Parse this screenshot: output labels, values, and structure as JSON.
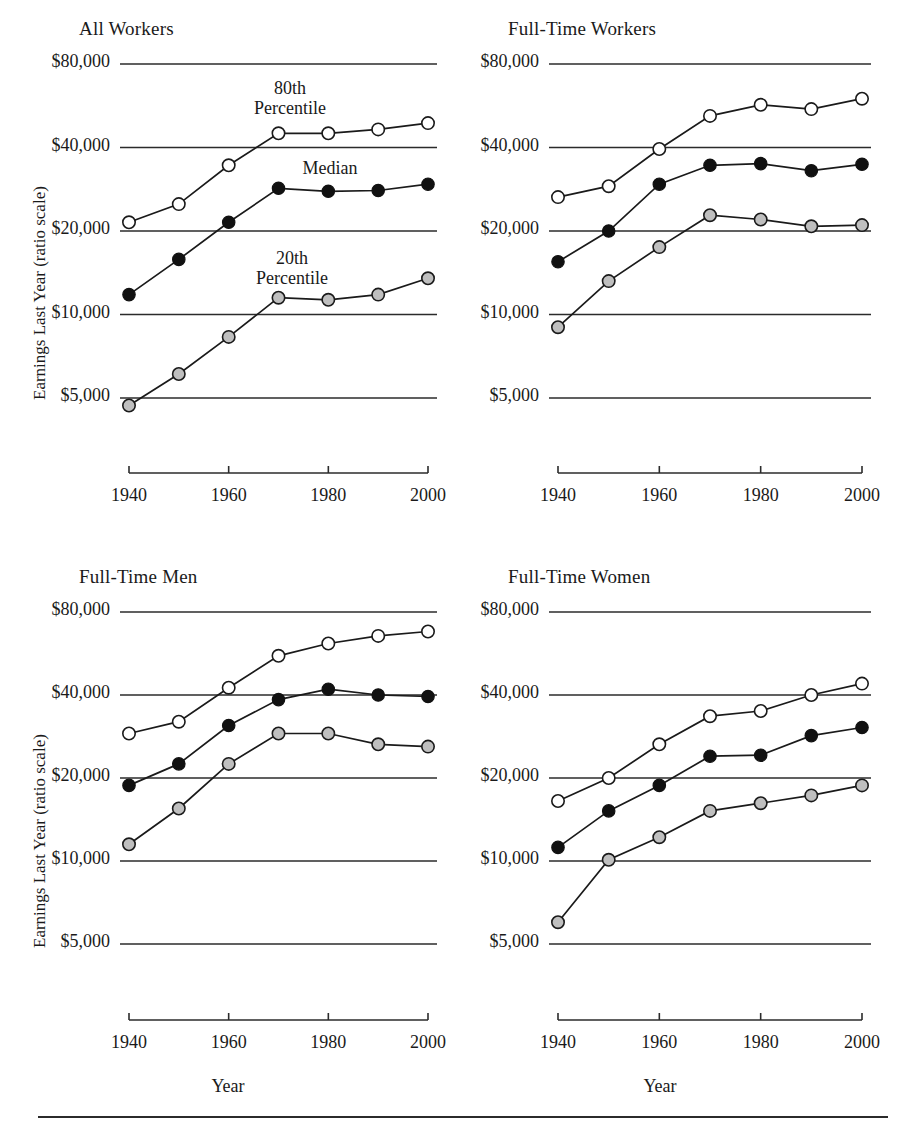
{
  "figure": {
    "background": "#ffffff",
    "footer_rule": true
  },
  "axis": {
    "ylabel": "Earnings Last Year (ratio scale)",
    "xlabel": "Year",
    "yticks": [
      "$80,000",
      "$40,000",
      "$20,000",
      "$10,000",
      "$5,000"
    ],
    "ytick_values": [
      80000,
      40000,
      20000,
      10000,
      5000
    ],
    "xticks": [
      "1940",
      "1960",
      "1980",
      "2000"
    ],
    "xtick_values": [
      1940,
      1960,
      1980,
      2000
    ],
    "xlim": [
      1935,
      2005
    ],
    "ylim": [
      4000,
      95000
    ],
    "scale": "log",
    "grid": "horizontal"
  },
  "series_styles": [
    {
      "key": "p80",
      "label": "80th Percentile",
      "marker": "open-circle",
      "fill": "#ffffff",
      "stroke": "#1a1a1a"
    },
    {
      "key": "median",
      "label": "Median",
      "marker": "filled-circle",
      "fill": "#111111",
      "stroke": "#111111"
    },
    {
      "key": "p20",
      "label": "20th Percentile",
      "marker": "gray-circle",
      "fill": "#bfbfbf",
      "stroke": "#1a1a1a"
    }
  ],
  "annotations": {
    "p80": {
      "line1": "80th",
      "line2": "Percentile"
    },
    "median": {
      "line1": "Median",
      "line2": ""
    },
    "p20": {
      "line1": "20th",
      "line2": "Percentile"
    }
  },
  "chart_data": [
    {
      "type": "line",
      "title": "All Workers",
      "xlabel": "",
      "ylabel": "Earnings Last Year (ratio scale)",
      "x": [
        1940,
        1950,
        1960,
        1970,
        1980,
        1990,
        2000
      ],
      "xlim": [
        1935,
        2005
      ],
      "ylim": [
        4000,
        95000
      ],
      "yscale": "log",
      "grid": true,
      "legend": "inline-annotations",
      "series": [
        {
          "name": "80th Percentile",
          "key": "p80",
          "values": [
            21500,
            25000,
            34500,
            45000,
            45000,
            46500,
            49000
          ]
        },
        {
          "name": "Median",
          "key": "median",
          "values": [
            11800,
            15800,
            21500,
            28500,
            27800,
            28000,
            29500
          ]
        },
        {
          "name": "20th Percentile",
          "key": "p20",
          "values": [
            4700,
            6100,
            8300,
            11500,
            11300,
            11800,
            13500
          ]
        }
      ]
    },
    {
      "type": "line",
      "title": "Full-Time  Workers",
      "xlabel": "",
      "ylabel": "",
      "x": [
        1940,
        1950,
        1960,
        1970,
        1980,
        1990,
        2000
      ],
      "xlim": [
        1935,
        2005
      ],
      "ylim": [
        4000,
        95000
      ],
      "yscale": "log",
      "grid": true,
      "legend": "none",
      "series": [
        {
          "name": "80th Percentile",
          "key": "p80",
          "values": [
            26500,
            29000,
            39500,
            52000,
            57000,
            55000,
            60000
          ]
        },
        {
          "name": "Median",
          "key": "median",
          "values": [
            15500,
            20000,
            29500,
            34500,
            35000,
            33000,
            34800
          ]
        },
        {
          "name": "20th Percentile",
          "key": "p20",
          "values": [
            9000,
            13200,
            17500,
            22800,
            22000,
            20800,
            21000
          ]
        }
      ]
    },
    {
      "type": "line",
      "title": "Full-Time  Men",
      "xlabel": "Year",
      "ylabel": "Earnings Last Year (ratio scale)",
      "x": [
        1940,
        1950,
        1960,
        1970,
        1980,
        1990,
        2000
      ],
      "xlim": [
        1935,
        2005
      ],
      "ylim": [
        4000,
        95000
      ],
      "yscale": "log",
      "grid": true,
      "legend": "none",
      "series": [
        {
          "name": "80th Percentile",
          "key": "p80",
          "values": [
            29000,
            32000,
            42500,
            55500,
            61500,
            65500,
            68000
          ]
        },
        {
          "name": "Median",
          "key": "median",
          "values": [
            18800,
            22500,
            31000,
            38500,
            42000,
            40000,
            39500
          ]
        },
        {
          "name": "20th Percentile",
          "key": "p20",
          "values": [
            11500,
            15500,
            22500,
            29000,
            29000,
            26500,
            26000
          ]
        }
      ]
    },
    {
      "type": "line",
      "title": "Full-Time  Women",
      "xlabel": "Year",
      "ylabel": "",
      "x": [
        1940,
        1950,
        1960,
        1970,
        1980,
        1990,
        2000
      ],
      "xlim": [
        1935,
        2005
      ],
      "ylim": [
        4000,
        95000
      ],
      "yscale": "log",
      "grid": true,
      "legend": "none",
      "series": [
        {
          "name": "80th Percentile",
          "key": "p80",
          "values": [
            16500,
            20000,
            26500,
            33500,
            35000,
            40000,
            44000
          ]
        },
        {
          "name": "Median",
          "key": "median",
          "values": [
            11200,
            15200,
            18800,
            24000,
            24200,
            28500,
            30500
          ]
        },
        {
          "name": "20th Percentile",
          "key": "p20",
          "values": [
            6000,
            10100,
            12200,
            15200,
            16200,
            17300,
            18800
          ]
        }
      ]
    }
  ]
}
